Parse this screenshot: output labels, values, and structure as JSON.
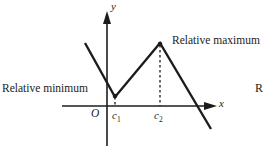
{
  "figure": {
    "name": "relative-extrema-graph",
    "background_color": "#ffffff",
    "stroke_color": "#1c1c1c"
  },
  "axes": {
    "x_label": "x",
    "y_label": "y",
    "origin_label": "O",
    "x_axis": {
      "y": 106,
      "x_start": 62,
      "x_end": 216
    },
    "y_axis": {
      "x": 107,
      "y_start": 14,
      "y_end": 146
    }
  },
  "ticks": [
    {
      "label": "c",
      "subscript": "1",
      "x": 118
    },
    {
      "label": "c",
      "subscript": "2",
      "x": 160
    }
  ],
  "annotations": [
    {
      "text": "Relative minimum",
      "target": "local-minimum",
      "x": 2,
      "y": 83
    },
    {
      "text": "Relative maximum",
      "target": "local-maximum",
      "x": 172,
      "y": 35
    }
  ],
  "edge_text": "R",
  "chart_data": {
    "type": "line",
    "title": "",
    "xlabel": "x",
    "ylabel": "y",
    "grid": false,
    "legend": false,
    "curve_points": [
      {
        "x": 85,
        "y": 43
      },
      {
        "x": 115,
        "y": 97
      },
      {
        "x": 160,
        "y": 43
      },
      {
        "x": 211,
        "y": 129
      }
    ],
    "markers": [
      {
        "name": "local-minimum",
        "x": 115,
        "y": 97,
        "kind": "relative minimum",
        "at": "c1"
      },
      {
        "name": "local-maximum",
        "x": 160,
        "y": 43,
        "kind": "relative maximum",
        "at": "c2"
      }
    ],
    "dashed_drop_lines": [
      {
        "x": 115,
        "y_top": 97,
        "y_bottom": 106
      },
      {
        "x": 160,
        "y_top": 43,
        "y_bottom": 106
      }
    ]
  }
}
